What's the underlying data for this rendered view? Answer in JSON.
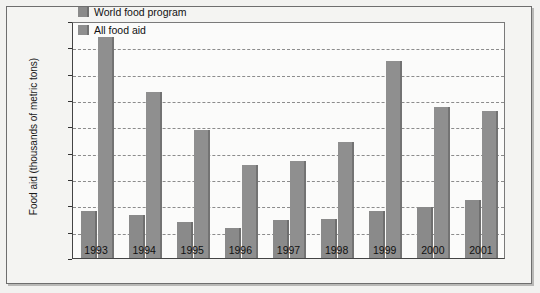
{
  "chart_data": {
    "type": "bar",
    "title": "",
    "xlabel": "",
    "ylabel": "Food aid (thousands of metric tons)",
    "categories": [
      "1993",
      "1994",
      "1995",
      "1996",
      "1997",
      "1998",
      "1999",
      "2000",
      "2001"
    ],
    "series": [
      {
        "name": "World food program",
        "values": [
          3600,
          3300,
          2700,
          2250,
          2900,
          3000,
          3550,
          3850,
          4400
        ]
      },
      {
        "name": "All food aid",
        "values": [
          16800,
          12600,
          9750,
          7100,
          7350,
          8800,
          15000,
          11500,
          11200
        ]
      }
    ],
    "yticks": [
      {
        "value": 0,
        "label": "0"
      },
      {
        "value": 2000,
        "label": "2000"
      },
      {
        "value": 4000,
        "label": "4000"
      },
      {
        "value": 6000,
        "label": "6000"
      },
      {
        "value": 8000,
        "label": "8000"
      },
      {
        "value": 10000,
        "label": "10,000"
      },
      {
        "value": 12000,
        "label": "12,000"
      },
      {
        "value": 14000,
        "label": "14,000"
      },
      {
        "value": 16000,
        "label": "16,000"
      },
      {
        "value": 18000,
        "label": "18,000"
      }
    ],
    "ylim": [
      0,
      18000
    ],
    "grid": true,
    "grid_style": "dashed-horizontal",
    "legend_position": "top-center-inside",
    "legend": [
      "World food program",
      "All food aid"
    ],
    "colors": {
      "series_0": "#8a8a8a",
      "series_1": "#8f8f8f",
      "plot_background": "#fbfbfa",
      "figure_background": "#f2f2f0",
      "gridline": "#8c8c8c",
      "axis": "#444444",
      "text": "#111111"
    }
  }
}
